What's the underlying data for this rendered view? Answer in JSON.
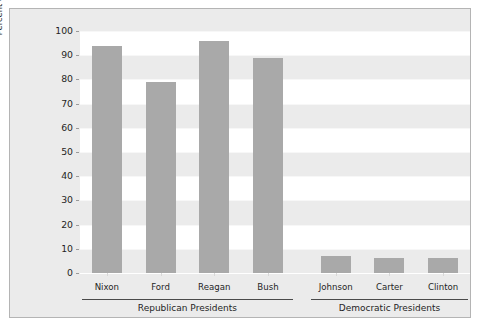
{
  "chart_data": {
    "type": "bar",
    "title": "",
    "subtitle": "",
    "xlabel": "",
    "ylabel": "Percent of Nominees Affiliated with Republican Party",
    "ylim": [
      0,
      100
    ],
    "ytick_labels": [
      "0",
      "10",
      "20",
      "30",
      "40",
      "50",
      "60",
      "70",
      "80",
      "90",
      "100"
    ],
    "ytick_values": [
      0,
      10,
      20,
      30,
      40,
      50,
      60,
      70,
      80,
      90,
      100
    ],
    "grid": "horizontal alternating bands",
    "legend": "none",
    "categories": [
      "Nixon",
      "Ford",
      "Reagan",
      "Bush",
      "Johnson",
      "Carter",
      "Clinton"
    ],
    "values": [
      94,
      79,
      96,
      89,
      7,
      6,
      6
    ],
    "bar_color": "#a9a9a9",
    "panel_background": "#ebebeb",
    "band_color": "#ffffff",
    "groups": [
      {
        "label": "Republican Presidents",
        "categories": [
          "Nixon",
          "Ford",
          "Reagan",
          "Bush"
        ]
      },
      {
        "label": "Democratic Presidents",
        "categories": [
          "Johnson",
          "Carter",
          "Clinton"
        ]
      }
    ]
  }
}
